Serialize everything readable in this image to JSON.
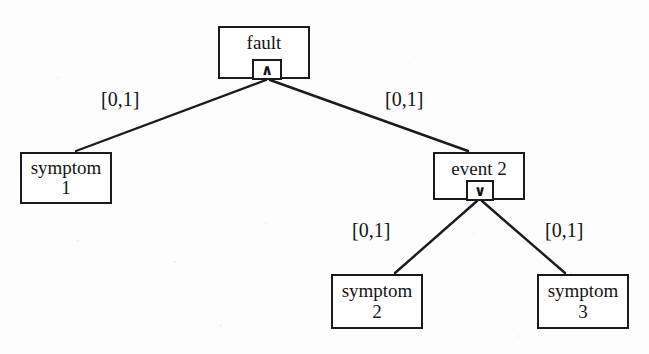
{
  "diagram": {
    "type": "fault-tree",
    "background_color": "#fdfdfd",
    "line_color": "#1b1b1b",
    "text_color": "#141414",
    "nodes": [
      {
        "id": "fault",
        "label": "fault",
        "kind": "gate",
        "gate_symbol": "∧",
        "gate_type": "AND",
        "x": 218,
        "y": 26,
        "w": 92,
        "h": 53
      },
      {
        "id": "symptom-1",
        "label": "symptom\n1",
        "kind": "leaf",
        "x": 20,
        "y": 152,
        "w": 92,
        "h": 52
      },
      {
        "id": "event-2",
        "label": "event 2",
        "kind": "gate",
        "gate_symbol": "∨",
        "gate_type": "OR",
        "x": 433,
        "y": 152,
        "w": 92,
        "h": 48
      },
      {
        "id": "symptom-2",
        "label": "symptom\n2",
        "kind": "leaf",
        "x": 331,
        "y": 274,
        "w": 92,
        "h": 55
      },
      {
        "id": "symptom-3",
        "label": "symptom\n3",
        "kind": "leaf",
        "x": 537,
        "y": 274,
        "w": 92,
        "h": 55
      }
    ],
    "edges": [
      {
        "id": "edge-fault-symptom1",
        "from": "fault",
        "to": "symptom-1",
        "label": "[0,1]",
        "x1": 266,
        "y1": 80,
        "x2": 76,
        "y2": 151,
        "label_x": 101,
        "label_y": 88
      },
      {
        "id": "edge-fault-event2",
        "from": "fault",
        "to": "event-2",
        "label": "[0,1]",
        "x1": 270,
        "y1": 80,
        "x2": 468,
        "y2": 151,
        "label_x": 385,
        "label_y": 88
      },
      {
        "id": "edge-event2-symptom2",
        "from": "event-2",
        "to": "symptom-2",
        "label": "[0,1]",
        "x1": 477,
        "y1": 201,
        "x2": 395,
        "y2": 273,
        "label_x": 352,
        "label_y": 219
      },
      {
        "id": "edge-event2-symptom3",
        "from": "event-2",
        "to": "symptom-3",
        "label": "[0,1]",
        "x1": 482,
        "y1": 201,
        "x2": 565,
        "y2": 273,
        "label_x": 545,
        "label_y": 219
      }
    ]
  }
}
